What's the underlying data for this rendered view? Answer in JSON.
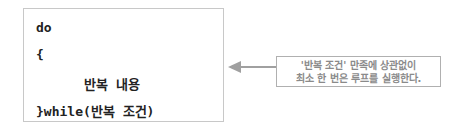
{
  "code": {
    "lines": [
      "do",
      "{",
      "반복 내용",
      "}while(반복 조건)"
    ]
  },
  "callout": {
    "line1": "'반복 조건' 만족에 상관없이",
    "line2": "최소 한 번은 루프를 실행한다."
  },
  "colors": {
    "arrow": "#a0a0a0",
    "callout_text": "#8a8a8a",
    "border": "#c8c8c8"
  }
}
